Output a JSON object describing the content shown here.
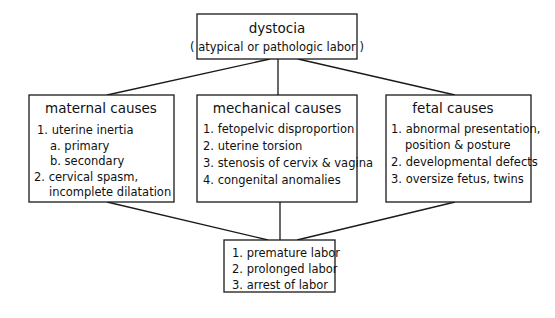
{
  "diagram": {
    "top": {
      "title": "dystocia",
      "subtitle": "( atypical or pathologic labor )"
    },
    "maternal": {
      "title": "maternal causes",
      "lines": [
        "1. uterine inertia",
        "a.  primary",
        "b.  secondary",
        "2. cervical spasm,",
        "incomplete dilatation"
      ]
    },
    "mechanical": {
      "title": "mechanical causes",
      "lines": [
        "1.  fetopelvic disproportion",
        "2. uterine torsion",
        "3. stenosis of cervix & vagina",
        "4. congenital anomalies"
      ]
    },
    "fetal": {
      "title": "fetal causes",
      "lines": [
        "1.  abnormal presentation,",
        "position & posture",
        "2.  developmental defects",
        "3. oversize fetus, twins"
      ]
    },
    "outcome": {
      "lines": [
        "1.  premature labor",
        "2. prolonged labor",
        "3. arrest of labor"
      ]
    }
  }
}
